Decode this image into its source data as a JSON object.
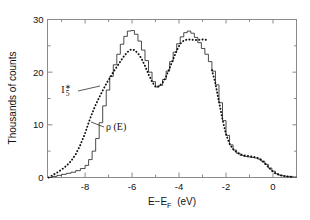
{
  "chart_data": {
    "type": "line",
    "title": "",
    "subtitle": "",
    "xlabel": "E−E",
    "xlabel_sub": "F",
    "xlabel_unit": "(eV)",
    "ylabel": "Thousands of counts",
    "xlim": [
      -9.6,
      1.0
    ],
    "ylim": [
      0,
      30
    ],
    "xticks": [
      -8,
      -6,
      -4,
      -2,
      0
    ],
    "xticklabels": [
      "-8",
      "-6",
      "-4",
      "-2",
      "0"
    ],
    "xminorticks": [
      -9,
      -7,
      -5,
      -3,
      -1,
      1
    ],
    "yticks": [
      0,
      10,
      20,
      30
    ],
    "yticklabels": [
      "0",
      "10",
      "20",
      "30"
    ],
    "yminorticks": [
      5,
      15,
      25
    ],
    "grid": false,
    "legend_position": "inline-annotations",
    "annotations": [
      {
        "name": "is-label",
        "text": "I",
        "sub": "5",
        "sup": "∗",
        "x_px": 66,
        "y_px": 93,
        "leader_from": [
          78,
          91
        ],
        "leader_to": [
          100,
          86
        ]
      },
      {
        "name": "rho-label",
        "text": "ρ (E)",
        "x_px": 106,
        "y_px": 130,
        "leader_from": [
          104,
          127
        ],
        "leader_to": [
          91,
          122
        ]
      }
    ],
    "series": [
      {
        "name": "ρ (E)",
        "style": "solid-staircase",
        "color": "#2a2a2a",
        "x": [
          -9.55,
          -9.4,
          -9.2,
          -9.0,
          -8.8,
          -8.6,
          -8.4,
          -8.2,
          -8.0,
          -7.85,
          -7.7,
          -7.55,
          -7.4,
          -7.25,
          -7.1,
          -6.95,
          -6.8,
          -6.65,
          -6.5,
          -6.35,
          -6.2,
          -6.05,
          -5.9,
          -5.75,
          -5.6,
          -5.45,
          -5.3,
          -5.15,
          -5.0,
          -4.85,
          -4.7,
          -4.55,
          -4.4,
          -4.25,
          -4.1,
          -3.95,
          -3.8,
          -3.65,
          -3.5,
          -3.35,
          -3.2,
          -3.05,
          -2.9,
          -2.75,
          -2.6,
          -2.45,
          -2.3,
          -2.15,
          -2.0,
          -1.85,
          -1.7,
          -1.55,
          -1.4,
          -1.25,
          -1.1,
          -0.95,
          -0.8,
          -0.65,
          -0.5,
          -0.35,
          -0.2,
          -0.05,
          0.1,
          0.25,
          0.4,
          0.55,
          0.7,
          0.85,
          1.0
        ],
        "y": [
          0.0,
          0.2,
          0.4,
          0.6,
          0.8,
          1.0,
          1.3,
          1.7,
          2.3,
          3.4,
          5.0,
          7.4,
          10.4,
          13.6,
          16.6,
          19.2,
          21.4,
          23.4,
          25.3,
          26.8,
          27.8,
          27.9,
          27.2,
          25.9,
          24.2,
          22.2,
          20.0,
          18.2,
          17.2,
          17.5,
          18.6,
          20.2,
          22.0,
          23.8,
          25.4,
          26.7,
          27.5,
          27.8,
          27.4,
          26.6,
          25.6,
          24.5,
          23.4,
          22.0,
          20.2,
          17.6,
          14.2,
          10.8,
          8.0,
          6.2,
          5.2,
          4.6,
          4.2,
          4.0,
          3.9,
          3.8,
          3.7,
          3.5,
          3.1,
          2.5,
          1.8,
          1.2,
          0.7,
          0.45,
          0.3,
          0.2,
          0.15,
          0.1,
          0.05
        ]
      },
      {
        "name": "I₅∗",
        "style": "dotted",
        "color": "#111111",
        "x": [
          -9.55,
          -9.4,
          -9.2,
          -9.0,
          -8.8,
          -8.6,
          -8.4,
          -8.2,
          -8.0,
          -7.85,
          -7.7,
          -7.55,
          -7.4,
          -7.25,
          -7.1,
          -6.95,
          -6.8,
          -6.65,
          -6.5,
          -6.35,
          -6.2,
          -6.05,
          -5.9,
          -5.75,
          -5.6,
          -5.45,
          -5.3,
          -5.15,
          -5.0,
          -4.85,
          -4.7,
          -4.55,
          -4.4,
          -4.25,
          -4.1,
          -3.95,
          -3.8,
          -3.65,
          -3.5,
          -3.35,
          -3.2,
          -3.05,
          -2.9,
          -2.75
        ],
        "y": [
          0.0,
          0.4,
          0.9,
          1.5,
          2.2,
          3.1,
          4.4,
          6.2,
          8.4,
          10.4,
          12.2,
          13.8,
          15.2,
          16.5,
          17.8,
          18.9,
          20.0,
          21.0,
          22.0,
          23.0,
          23.8,
          24.3,
          24.2,
          23.6,
          22.6,
          21.2,
          19.6,
          18.2,
          17.2,
          17.3,
          18.0,
          19.2,
          20.8,
          22.5,
          24.1,
          25.4,
          26.0,
          26.2,
          26.2,
          26.1,
          26.1,
          26.2,
          26.2,
          26.0
        ]
      },
      {
        "name": "I₅∗ tail",
        "style": "dotted",
        "color": "#111111",
        "x": [
          -2.6,
          -2.45,
          -2.3,
          -2.15,
          -2.0,
          -1.85,
          -1.7,
          -1.55,
          -1.4,
          -1.25,
          -1.1,
          -0.95,
          -0.8,
          -0.65,
          -0.5,
          -0.35,
          -0.2,
          -0.05,
          0.1,
          0.25,
          0.4,
          0.55,
          0.7,
          0.85
        ],
        "y": [
          20.4,
          17.8,
          14.4,
          11.0,
          8.2,
          6.4,
          5.4,
          4.8,
          4.4,
          4.2,
          4.1,
          4.0,
          3.9,
          3.7,
          3.3,
          2.7,
          2.0,
          1.3,
          0.8,
          0.5,
          0.32,
          0.22,
          0.16,
          0.1
        ]
      }
    ]
  }
}
